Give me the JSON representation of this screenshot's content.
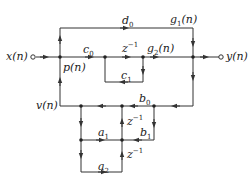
{
  "diagram": {
    "type": "signal-flow-graph",
    "input": {
      "label": "x(n)"
    },
    "output": {
      "label": "y(n)"
    },
    "nodes": {
      "p": {
        "label": "p(n)"
      },
      "v": {
        "label": "v(n)"
      },
      "g1": {
        "label": "g",
        "sub": "1",
        "rest": "(n)"
      },
      "g2": {
        "label": "g",
        "sub": "2",
        "rest": "(n)"
      }
    },
    "coefficients": {
      "d0": {
        "base": "d",
        "sub": "0"
      },
      "c0": {
        "base": "c",
        "sub": "0"
      },
      "c1": {
        "base": "c",
        "sub": "1"
      },
      "b0": {
        "base": "b",
        "sub": "0"
      },
      "b1": {
        "base": "b",
        "sub": "1"
      },
      "a1": {
        "base": "a",
        "sub": "1"
      },
      "a2": {
        "base": "a",
        "sub": "2"
      }
    },
    "delays": {
      "top": {
        "base": "z",
        "sup": "−1"
      },
      "mid": {
        "base": "z",
        "sup": "−1"
      },
      "low": {
        "base": "z",
        "sup": "−1"
      }
    },
    "colors": {
      "line": "#333333",
      "text": "#222222",
      "background": "#ffffff"
    }
  }
}
